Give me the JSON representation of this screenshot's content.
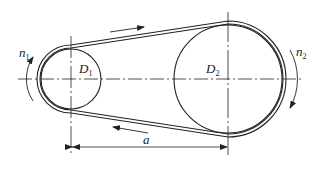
{
  "diagram": {
    "type": "belt-drive",
    "labels": {
      "small_pulley": "D",
      "small_pulley_sub": "1",
      "large_pulley": "D",
      "large_pulley_sub": "2",
      "speed_1": "n",
      "speed_1_sub": "1",
      "speed_2": "n",
      "speed_2_sub": "2",
      "center_distance": "a"
    },
    "colors": {
      "line": "#222222",
      "background": "#ffffff"
    }
  }
}
